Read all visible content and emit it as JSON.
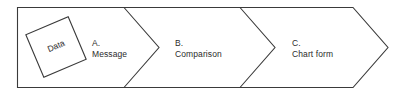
{
  "diagram": {
    "type": "process-arrow",
    "title": "",
    "canvas": {
      "width": 403,
      "height": 96
    },
    "colors": {
      "background": "#ffffff",
      "stroke": "#3a3a3a",
      "text": "#2b2b2b",
      "fill": "#ffffff"
    },
    "data_node": {
      "label": "Data",
      "shape": "rotated-square",
      "rotation_degrees": -23
    },
    "stages": [
      {
        "letter": "A.",
        "label": "Message"
      },
      {
        "letter": "B.",
        "label": "Comparison"
      },
      {
        "letter": "C.",
        "label": "Chart form"
      }
    ]
  }
}
